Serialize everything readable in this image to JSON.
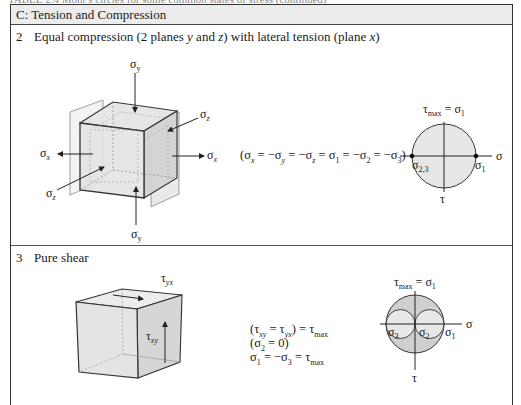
{
  "caption": "TABLE 2.4   Mohr's circles for some common states of stress (continued)",
  "section": {
    "header": "C: Tension and Compression"
  },
  "rows": [
    {
      "number": "2",
      "title": "Equal compression (2 planes y and z) with lateral tension (plane x)",
      "title_parts": [
        "Equal compression (2 planes ",
        "y",
        " and ",
        "z",
        ") with lateral tension (plane ",
        "x",
        ")"
      ],
      "cube_labels": {
        "sigma_y_top": "σ",
        "sigma_y_top_sub": "y",
        "sigma_y_bottom": "σ",
        "sigma_y_bottom_sub": "y",
        "sigma_x_left": "σ",
        "sigma_x_left_sub": "x",
        "sigma_x_right": "σ",
        "sigma_x_right_sub": "x",
        "sigma_z_front": "σ",
        "sigma_z_front_sub": "z",
        "sigma_z_back": "σ",
        "sigma_z_back_sub": "z"
      },
      "equation": "(σx = −σy = −σz = σ1 = −σ2 = −σ3)",
      "mohr": {
        "top_label": "τmax = σ1",
        "axis_sigma": "σ",
        "axis_tau": "τ",
        "left_point": "σ2,3",
        "right_point": "σ1"
      }
    },
    {
      "number": "3",
      "title": "Pure shear",
      "cube_labels": {
        "tau_yx": "τ",
        "tau_yx_sub": "yx",
        "tau_xy": "τ",
        "tau_xy_sub": "xy"
      },
      "equations": [
        "(τxy = τyx) = τmax",
        "(σ2 = 0)",
        "σ1 = −σ3 = τmax"
      ],
      "mohr": {
        "top_label": "τmax = σ1",
        "axis_sigma": "σ",
        "axis_tau": "τ",
        "left_point": "σ3",
        "center_point": "σ2",
        "right_point": "σ1"
      }
    }
  ],
  "colors": {
    "header_fill": "#ececec",
    "face_fill": "#d9d9d9",
    "circle_fill": "#e4e4e4",
    "circle_fill_dark": "#cfcfcf",
    "line": "#333333"
  }
}
